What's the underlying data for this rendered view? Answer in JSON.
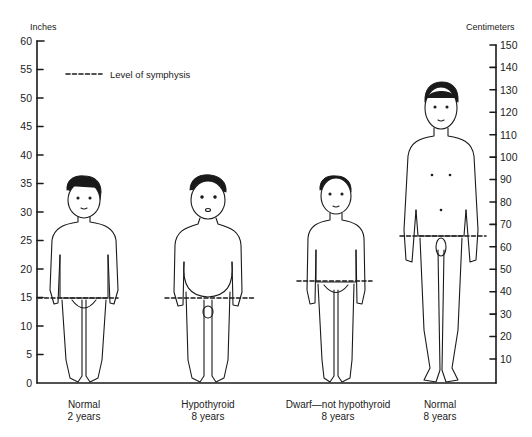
{
  "diagram": {
    "type": "comparative-stature-illustration",
    "left_axis": {
      "title": "Inches",
      "ticks": [
        "60",
        "55",
        "50",
        "45",
        "40",
        "35",
        "30",
        "25",
        "20",
        "15",
        "10",
        "5",
        "0"
      ]
    },
    "right_axis": {
      "title": "Centimeters",
      "ticks": [
        "150",
        "140",
        "130",
        "120",
        "110",
        "100",
        "90",
        "80",
        "70",
        "60",
        "50",
        "40",
        "30",
        "20",
        "10"
      ]
    },
    "legend": {
      "line_style": "dashed",
      "label": "Level of symphysis"
    },
    "figures": [
      {
        "id": "normal-2y",
        "label": "Normal",
        "age": "2 years",
        "height_in": 35,
        "symphysis_in": 15
      },
      {
        "id": "hypothyroid-8y",
        "label": "Hypothyroid",
        "age": "8 years",
        "height_in": 35,
        "symphysis_in": 15
      },
      {
        "id": "dwarf-8y",
        "label": "Dwarf—not hypothyroid",
        "age": "8 years",
        "height_in": 36,
        "symphysis_in": 18
      },
      {
        "id": "normal-8y",
        "label": "Normal",
        "age": "8 years",
        "height_in": 53,
        "symphysis_in": 26
      }
    ]
  }
}
